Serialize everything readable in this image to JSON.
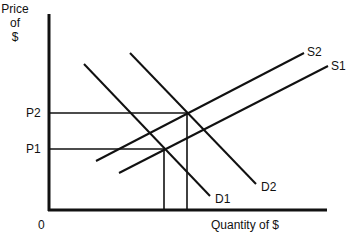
{
  "diagram": {
    "type": "supply-demand",
    "y_axis_label": [
      "Price",
      "of",
      "$"
    ],
    "x_axis_label": "Quantity of $",
    "origin_label": "0",
    "price_levels": [
      {
        "label": "P2",
        "meets_at": "S2 x D2"
      },
      {
        "label": "P1",
        "meets_at": "S1 x D1"
      }
    ],
    "curves": [
      {
        "label": "S1",
        "kind": "supply"
      },
      {
        "label": "S2",
        "kind": "supply"
      },
      {
        "label": "D1",
        "kind": "demand"
      },
      {
        "label": "D2",
        "kind": "demand"
      }
    ],
    "colors": {
      "line": "#111111",
      "background": "#ffffff"
    }
  }
}
